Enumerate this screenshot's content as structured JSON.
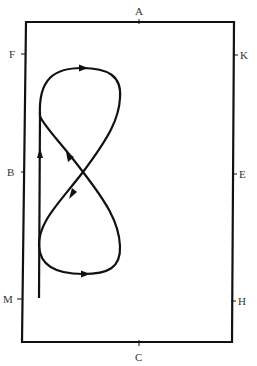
{
  "diagram": {
    "type": "dressage-arena-figure-of-eight",
    "colors": {
      "line": "#111111",
      "label": "#333333",
      "background": "#ffffff"
    },
    "markers": {
      "top": "A",
      "bottom": "C",
      "left_top": "F",
      "left_middle": "B",
      "left_bottom": "M",
      "right_top": "K",
      "right_middle": "E",
      "right_bottom": "H"
    },
    "path": {
      "description": "Rider enters up the left track, then rides a figure-of-eight; arrows show direction of travel",
      "arrows": [
        "up on left straight line",
        "right on top loop",
        "up-left on diagonal",
        "down-left on diagonal",
        "right on bottom loop"
      ]
    }
  }
}
